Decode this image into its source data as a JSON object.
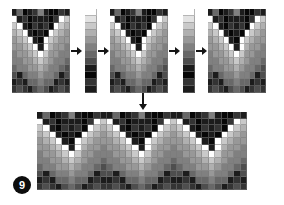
{
  "figure": {
    "number": "9",
    "caption_badge_label": "9",
    "background_color": "#ffffff",
    "ink_color": "#151515"
  },
  "palette": {
    "levels": [
      "#ffffff",
      "#e3e3e3",
      "#c9c9c9",
      "#b0b0b0",
      "#989898",
      "#808080",
      "#686868",
      "#4e4e4e",
      "#343434",
      "#1c1c1c",
      "#070707"
    ],
    "names": [
      "white",
      "near-white",
      "light-gray-1",
      "light-gray-2",
      "mid-gray-1",
      "mid-gray-2",
      "mid-gray-3",
      "dark-gray-1",
      "dark-gray-2",
      "near-black",
      "black"
    ]
  },
  "arrows": {
    "right_1_label": "step-1-to-palette-a",
    "right_2_label": "palette-a-to-motif-b",
    "right_3_label": "motif-b-to-palette-b",
    "right_4_label": "palette-b-to-motif-c",
    "down_label": "motifs-to-tiled-result"
  },
  "motif_a": {
    "title": "motif-grid-a",
    "cols": 11,
    "rows": 12,
    "grid": [
      [
        9,
        6,
        10,
        9,
        8,
        5,
        9,
        10,
        10,
        8,
        9
      ],
      [
        0,
        9,
        8,
        10,
        9,
        9,
        9,
        10,
        8,
        0,
        2
      ],
      [
        2,
        0,
        9,
        10,
        8,
        9,
        8,
        10,
        0,
        2,
        3
      ],
      [
        3,
        2,
        0,
        9,
        10,
        9,
        10,
        0,
        2,
        3,
        4
      ],
      [
        4,
        3,
        2,
        0,
        9,
        10,
        0,
        2,
        3,
        4,
        4
      ],
      [
        4,
        4,
        3,
        2,
        0,
        9,
        0,
        3,
        4,
        4,
        5
      ],
      [
        5,
        4,
        4,
        3,
        2,
        0,
        2,
        4,
        4,
        5,
        5
      ],
      [
        5,
        5,
        4,
        4,
        3,
        2,
        3,
        4,
        5,
        5,
        6
      ],
      [
        6,
        5,
        5,
        4,
        4,
        3,
        4,
        5,
        5,
        6,
        7
      ],
      [
        7,
        9,
        6,
        5,
        5,
        4,
        5,
        5,
        6,
        9,
        7
      ],
      [
        9,
        8,
        9,
        6,
        6,
        5,
        6,
        6,
        9,
        8,
        9
      ],
      [
        8,
        7,
        8,
        9,
        7,
        6,
        7,
        9,
        8,
        7,
        8
      ]
    ]
  },
  "motif_b": {
    "title": "motif-grid-b",
    "cols": 11,
    "rows": 12,
    "grid": [
      [
        9,
        6,
        10,
        9,
        8,
        5,
        9,
        10,
        10,
        8,
        9
      ],
      [
        0,
        9,
        8,
        10,
        9,
        9,
        9,
        10,
        8,
        0,
        2
      ],
      [
        2,
        0,
        9,
        10,
        8,
        9,
        8,
        10,
        0,
        2,
        3
      ],
      [
        3,
        2,
        0,
        9,
        10,
        9,
        10,
        0,
        2,
        3,
        4
      ],
      [
        4,
        3,
        2,
        0,
        9,
        10,
        0,
        2,
        3,
        4,
        4
      ],
      [
        4,
        4,
        3,
        2,
        0,
        9,
        0,
        3,
        4,
        4,
        5
      ],
      [
        5,
        4,
        4,
        3,
        2,
        0,
        2,
        4,
        4,
        5,
        5
      ],
      [
        5,
        5,
        4,
        4,
        3,
        2,
        3,
        4,
        5,
        5,
        6
      ],
      [
        6,
        5,
        5,
        4,
        4,
        3,
        4,
        5,
        5,
        6,
        7
      ],
      [
        7,
        9,
        6,
        5,
        5,
        4,
        5,
        5,
        6,
        9,
        7
      ],
      [
        9,
        8,
        9,
        6,
        6,
        5,
        6,
        6,
        9,
        8,
        9
      ],
      [
        8,
        7,
        8,
        9,
        7,
        6,
        7,
        9,
        8,
        7,
        8
      ]
    ]
  },
  "motif_c": {
    "title": "motif-grid-c",
    "cols": 11,
    "rows": 12,
    "grid": [
      [
        9,
        6,
        10,
        9,
        8,
        5,
        9,
        10,
        10,
        8,
        9
      ],
      [
        0,
        9,
        8,
        10,
        9,
        9,
        9,
        10,
        8,
        0,
        2
      ],
      [
        2,
        0,
        9,
        10,
        8,
        9,
        8,
        10,
        0,
        2,
        3
      ],
      [
        3,
        2,
        0,
        9,
        10,
        9,
        10,
        0,
        2,
        3,
        4
      ],
      [
        4,
        3,
        2,
        0,
        9,
        10,
        0,
        2,
        3,
        4,
        4
      ],
      [
        4,
        4,
        3,
        2,
        0,
        9,
        0,
        3,
        4,
        4,
        5
      ],
      [
        5,
        4,
        4,
        3,
        2,
        0,
        2,
        4,
        4,
        5,
        5
      ],
      [
        5,
        5,
        4,
        4,
        3,
        2,
        3,
        4,
        5,
        5,
        6
      ],
      [
        6,
        5,
        5,
        4,
        4,
        3,
        4,
        5,
        5,
        6,
        7
      ],
      [
        7,
        9,
        6,
        5,
        5,
        4,
        5,
        5,
        6,
        9,
        7
      ],
      [
        9,
        8,
        9,
        6,
        6,
        5,
        6,
        6,
        9,
        8,
        9
      ],
      [
        8,
        7,
        8,
        9,
        7,
        6,
        7,
        9,
        8,
        7,
        8
      ]
    ]
  },
  "strip_a": {
    "title": "palette-strip-a",
    "cols": 1,
    "rows": 12,
    "grid": [
      [
        0
      ],
      [
        1
      ],
      [
        2
      ],
      [
        3
      ],
      [
        4
      ],
      [
        5
      ],
      [
        6
      ],
      [
        7
      ],
      [
        9
      ],
      [
        10
      ],
      [
        8
      ],
      [
        9
      ]
    ]
  },
  "strip_b": {
    "title": "palette-strip-b",
    "cols": 1,
    "rows": 12,
    "grid": [
      [
        0
      ],
      [
        1
      ],
      [
        2
      ],
      [
        3
      ],
      [
        4
      ],
      [
        5
      ],
      [
        6
      ],
      [
        7
      ],
      [
        9
      ],
      [
        10
      ],
      [
        8
      ],
      [
        9
      ]
    ]
  },
  "tiled": {
    "title": "tiled-result-grid",
    "cols": 33,
    "rows": 12,
    "repeats": 3,
    "grid": [
      [
        9,
        6,
        10,
        9,
        8,
        5,
        9,
        10,
        10,
        8,
        9,
        9,
        6,
        10,
        9,
        8,
        5,
        9,
        10,
        10,
        8,
        9,
        9,
        6,
        10,
        9,
        8,
        5,
        9,
        10,
        10,
        8,
        9
      ],
      [
        0,
        9,
        8,
        10,
        9,
        9,
        9,
        10,
        8,
        0,
        2,
        0,
        9,
        8,
        10,
        9,
        9,
        9,
        10,
        8,
        0,
        2,
        0,
        9,
        8,
        10,
        9,
        9,
        9,
        10,
        8,
        0,
        2
      ],
      [
        2,
        0,
        9,
        10,
        8,
        9,
        8,
        10,
        0,
        2,
        3,
        2,
        0,
        9,
        10,
        8,
        9,
        8,
        10,
        0,
        2,
        3,
        2,
        0,
        9,
        10,
        8,
        9,
        8,
        10,
        0,
        2,
        3
      ],
      [
        3,
        2,
        0,
        9,
        10,
        9,
        10,
        0,
        2,
        3,
        4,
        3,
        2,
        0,
        9,
        10,
        9,
        10,
        0,
        2,
        3,
        4,
        3,
        2,
        0,
        9,
        10,
        9,
        10,
        0,
        2,
        3,
        4
      ],
      [
        4,
        3,
        2,
        0,
        9,
        10,
        0,
        2,
        3,
        4,
        4,
        4,
        3,
        2,
        0,
        9,
        10,
        0,
        2,
        3,
        4,
        4,
        4,
        3,
        2,
        0,
        9,
        10,
        0,
        2,
        3,
        4,
        4
      ],
      [
        4,
        4,
        3,
        2,
        0,
        9,
        0,
        3,
        4,
        4,
        5,
        4,
        4,
        3,
        2,
        0,
        9,
        0,
        3,
        4,
        4,
        5,
        4,
        4,
        3,
        2,
        0,
        9,
        0,
        3,
        4,
        4,
        5
      ],
      [
        5,
        4,
        4,
        3,
        2,
        0,
        2,
        4,
        4,
        5,
        5,
        5,
        4,
        4,
        3,
        2,
        0,
        2,
        4,
        4,
        5,
        5,
        5,
        4,
        4,
        3,
        2,
        0,
        2,
        4,
        4,
        5,
        5
      ],
      [
        5,
        5,
        4,
        4,
        3,
        2,
        3,
        4,
        5,
        5,
        6,
        5,
        5,
        4,
        4,
        3,
        2,
        3,
        4,
        5,
        5,
        6,
        5,
        5,
        4,
        4,
        3,
        2,
        3,
        4,
        5,
        5,
        6
      ],
      [
        6,
        5,
        5,
        4,
        4,
        3,
        4,
        5,
        5,
        6,
        7,
        6,
        5,
        5,
        4,
        4,
        3,
        4,
        5,
        5,
        6,
        7,
        6,
        5,
        5,
        4,
        4,
        3,
        4,
        5,
        5,
        6,
        7
      ],
      [
        7,
        9,
        6,
        5,
        5,
        4,
        5,
        5,
        6,
        9,
        7,
        7,
        9,
        6,
        5,
        5,
        4,
        5,
        5,
        6,
        9,
        7,
        7,
        9,
        6,
        5,
        5,
        4,
        5,
        5,
        6,
        9,
        7
      ],
      [
        9,
        8,
        9,
        6,
        6,
        5,
        6,
        6,
        9,
        8,
        9,
        9,
        8,
        9,
        6,
        6,
        5,
        6,
        6,
        9,
        8,
        9,
        9,
        8,
        9,
        6,
        6,
        5,
        6,
        6,
        9,
        8,
        9
      ],
      [
        8,
        7,
        8,
        9,
        7,
        6,
        7,
        9,
        8,
        7,
        8,
        8,
        7,
        8,
        9,
        7,
        6,
        7,
        9,
        8,
        7,
        8,
        8,
        7,
        8,
        9,
        7,
        6,
        7,
        9,
        8,
        7,
        8
      ]
    ]
  }
}
